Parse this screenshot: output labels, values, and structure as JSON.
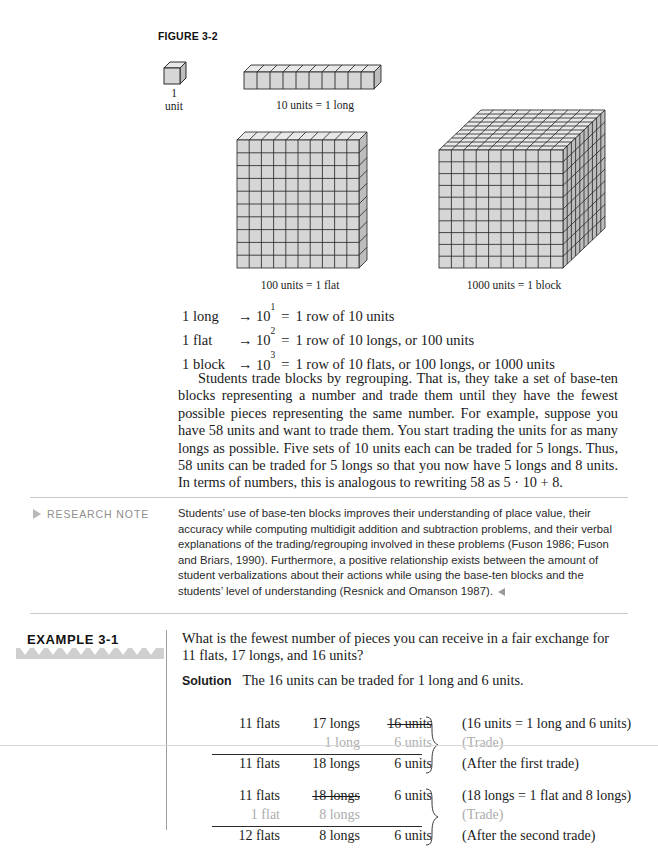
{
  "figure": {
    "label": "FIGURE 3-2",
    "unit_caption_line1": "1",
    "unit_caption_line2": "unit",
    "long_caption": "10 units = 1 long",
    "flat_caption": "100 units = 1 flat",
    "block_caption": "1000 units = 1 block"
  },
  "equations": [
    {
      "name": "1 long",
      "arrow": "→",
      "base": "10",
      "exp": "1",
      "eq": "=",
      "text": "1 row of 10 units"
    },
    {
      "name": "1 flat",
      "arrow": "→",
      "base": "10",
      "exp": "2",
      "eq": "=",
      "text": "1 row of 10 longs, or 100 units"
    },
    {
      "name": "1 block",
      "arrow": "→",
      "base": "10",
      "exp": "3",
      "eq": "=",
      "text": "1 row of 10 flats, or 100 longs, or 1000 units"
    }
  ],
  "body": {
    "paragraph": "Students trade blocks by regrouping. That is, they take a set of base-ten blocks representing a number and trade them until they have the fewest possible pieces representing the same number. For example, suppose you have 58 units and want to trade them. You start trading the units for as many longs as possible. Five sets of 10 units each can be traded for 5 longs. Thus, 58 units can be traded for 5 longs so that you now have 5 longs and 8 units. In terms of numbers, this is analogous to rewriting 58 as 5 · 10 + 8."
  },
  "research_note": {
    "heading": "RESEARCH NOTE",
    "text": "Students’ use of base-ten blocks improves their understanding of place value, their accuracy while computing multidigit addition and subtraction problems, and their verbal explanations of the trading/regrouping involved in these problems (Fuson 1986; Fuson and Briars, 1990). Furthermore, a positive relationship exists between the amount of student verbalizations about their actions while using the base-ten blocks and the students’ level of understanding (Resnick and Omanson 1987)."
  },
  "example": {
    "heading": "EXAMPLE 3-1",
    "question": "What is the fewest number of pieces you can receive in a fair exchange for 11 flats, 17 longs, and 16 units?",
    "solution_label": "Solution",
    "solution_text": "The 16 units can be traded for 1 long and 6 units.",
    "trade1": {
      "rows": [
        {
          "flats": "11 flats",
          "longs": "17 longs",
          "units": "16 units",
          "note": "(16 units  =  1 long and 6 units)",
          "style": "strike-units"
        },
        {
          "flats": "",
          "longs": "1 long",
          "units": "6 units",
          "note": "(Trade)",
          "style": "gray"
        },
        {
          "flats": "11 flats",
          "longs": "18 longs",
          "units": "6 units",
          "note": "(After the first trade)",
          "style": "result"
        }
      ]
    },
    "trade2": {
      "rows": [
        {
          "flats": "11 flats",
          "longs": "18 longs",
          "units": "6 units",
          "note": "(18 longs  =  1 flat and 8 longs)",
          "style": "strike-longs"
        },
        {
          "flats": "1 flat",
          "longs": "8 longs",
          "units": "",
          "note": "(Trade)",
          "style": "gray"
        },
        {
          "flats": "12 flats",
          "longs": "8 longs",
          "units": "6 units",
          "note": "(After the second trade)",
          "style": "result"
        }
      ]
    }
  },
  "colors": {
    "block_fill": "#d6d6d6",
    "block_top": "#e8e8e8",
    "block_side": "#bdbdbd",
    "stroke": "#2b2b2b",
    "rule": "#c9c9c9",
    "muted": "#adadad",
    "note_gray": "#8e8e8e"
  }
}
